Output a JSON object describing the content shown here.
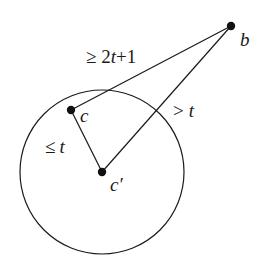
{
  "diagram": {
    "points": {
      "b": {
        "label": "b",
        "x": 231,
        "y": 26
      },
      "c": {
        "label": "c",
        "x": 71,
        "y": 110
      },
      "c_prime": {
        "label": "c'",
        "x": 102,
        "y": 172
      }
    },
    "circle": {
      "cx": 102,
      "cy": 172,
      "r": 82
    },
    "edges": [
      {
        "from": "c",
        "to": "b",
        "label": "≥ 2t+1"
      },
      {
        "from": "c_prime",
        "to": "b",
        "label": "> t"
      },
      {
        "from": "c",
        "to": "c_prime",
        "label": "≤ t"
      }
    ],
    "labels": {
      "cb_ge": "≥ 2",
      "cb_t": "t",
      "cb_plus": "+1",
      "cpb_gt": ">",
      "cpb_t": "t",
      "ccp_le": "≤",
      "ccp_t": "t",
      "point_b": "b",
      "point_c": "c",
      "point_cp": "c′"
    },
    "colors": {
      "stroke": "#1a1a1a",
      "background": "#ffffff"
    }
  }
}
